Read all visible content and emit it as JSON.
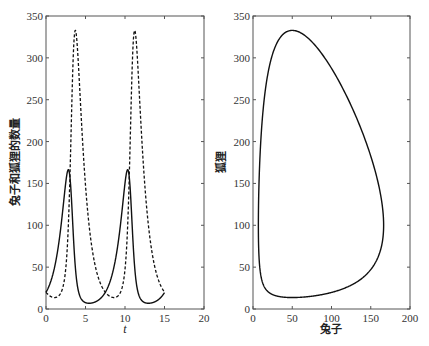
{
  "chart_data": [
    {
      "type": "line",
      "title": "",
      "xlabel": "t",
      "ylabel": "兔子和狐狸的数量",
      "xlim": [
        0,
        20
      ],
      "ylim": [
        0,
        350
      ],
      "xticks": [
        0,
        5,
        10,
        15,
        20
      ],
      "yticks": [
        0,
        50,
        100,
        150,
        200,
        250,
        300,
        350
      ],
      "grid": false,
      "legend": null,
      "series": [
        {
          "name": "兔子",
          "style": "solid",
          "x": [
            0,
            1,
            2,
            2.8,
            3.5,
            4,
            5,
            5.5,
            7,
            8,
            9,
            10,
            10.4,
            11,
            12,
            13,
            14,
            15
          ],
          "y": [
            20,
            45,
            100,
            165,
            60,
            20,
            6,
            5,
            15,
            35,
            80,
            145,
            165,
            90,
            15,
            5,
            8,
            17
          ]
        },
        {
          "name": "狐狸",
          "style": "dashed",
          "x": [
            0,
            1.2,
            2.5,
            3,
            3.6,
            4.5,
            5,
            6,
            7,
            8,
            8.8,
            10,
            10.5,
            11.2,
            12,
            13,
            14,
            15
          ],
          "y": [
            20,
            12,
            40,
            150,
            332,
            250,
            180,
            95,
            50,
            20,
            12,
            60,
            160,
            332,
            230,
            100,
            45,
            20
          ]
        }
      ],
      "model": {
        "equations": [
          "dx/dt = x(1 - 0.01y)",
          "dy/dt = y(-1 + 0.02x)"
        ],
        "x0": 20,
        "y0": 20,
        "t_span": [
          0,
          15
        ]
      }
    },
    {
      "type": "line",
      "title": "",
      "xlabel": "兔子",
      "ylabel": "狐狸",
      "xlim": [
        0,
        200
      ],
      "ylim": [
        0,
        350
      ],
      "xticks": [
        0,
        50,
        100,
        150,
        200
      ],
      "yticks": [
        0,
        50,
        100,
        150,
        200,
        250,
        300,
        350
      ],
      "grid": false,
      "legend": null,
      "series": [
        {
          "name": "phase trajectory",
          "style": "solid",
          "x": [
            20,
            50,
            100,
            150,
            165,
            150,
            100,
            50,
            20,
            8,
            6,
            8,
            12,
            20
          ],
          "y": [
            20,
            12,
            18,
            45,
            100,
            160,
            260,
            332,
            310,
            220,
            100,
            40,
            25,
            20
          ]
        }
      ]
    }
  ],
  "plots": {
    "left": {
      "xlabel": "t",
      "ylabel": "兔子和狐狸的数量",
      "xticks": [
        "0",
        "5",
        "10",
        "15",
        "20"
      ],
      "yticks": [
        "0",
        "50",
        "100",
        "150",
        "200",
        "250",
        "300",
        "350"
      ]
    },
    "right": {
      "xlabel": "兔子",
      "ylabel": "狐狸",
      "xticks": [
        "0",
        "50",
        "100",
        "150",
        "200"
      ],
      "yticks": [
        "0",
        "50",
        "100",
        "150",
        "200",
        "250",
        "300",
        "350"
      ]
    }
  },
  "colors": {
    "line": "#111111",
    "axis": "#555555",
    "background": "#ffffff"
  }
}
